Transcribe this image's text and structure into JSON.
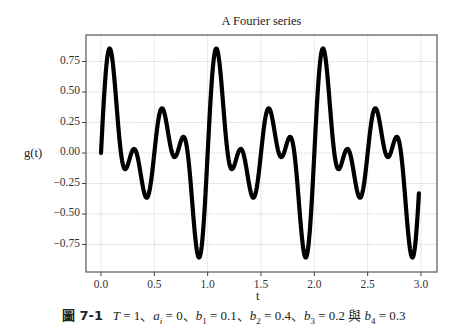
{
  "chart_data": {
    "type": "line",
    "title": "A Fourier series",
    "xlabel": "t",
    "ylabel": "g(t)",
    "xlim": [
      -0.12,
      3.15
    ],
    "ylim": [
      -0.93,
      0.93
    ],
    "x_ticks": [
      "0.0",
      "0.5",
      "1.0",
      "1.5",
      "2.0",
      "2.5",
      "3.0"
    ],
    "y_ticks": [
      "0.75",
      "0.50",
      "0.25",
      "0.00",
      "−0.25",
      "−0.50",
      "−0.75"
    ],
    "grid": true,
    "legend": null,
    "series": [
      {
        "name": "g(t)",
        "formula": "0.1 sin(2πt) + 0.4 sin(4πt) + 0.2 sin(6πt) + 0.3 sin(8πt)",
        "x_range": [
          0,
          2.98
        ],
        "color": "#000000",
        "key_points": [
          {
            "t": 0.0,
            "g": 0.0
          },
          {
            "t": 0.08,
            "g": 0.86
          },
          {
            "t": 0.2,
            "g": -0.12
          },
          {
            "t": 0.25,
            "g": 0.03
          },
          {
            "t": 0.34,
            "g": -0.36
          },
          {
            "t": 0.5,
            "g": 0.37
          },
          {
            "t": 0.6,
            "g": -0.03
          },
          {
            "t": 0.66,
            "g": 0.13
          },
          {
            "t": 0.75,
            "g": -0.03
          },
          {
            "t": 0.92,
            "g": -0.86
          },
          {
            "t": 1.08,
            "g": 0.86
          },
          {
            "t": 2.08,
            "g": 0.86
          },
          {
            "t": 2.92,
            "g": -0.86
          },
          {
            "t": 2.98,
            "g": -0.16
          }
        ]
      }
    ]
  },
  "caption": {
    "figure_label": "圖 7-1",
    "params": [
      {
        "sym": "T",
        "sub": "",
        "eq": " = 1"
      },
      {
        "sym": "a",
        "sub": "i",
        "eq": " = 0"
      },
      {
        "sym": "b",
        "sub": "1",
        "eq": " = 0.1"
      },
      {
        "sym": "b",
        "sub": "2",
        "eq": " = 0.4"
      },
      {
        "sym": "b",
        "sub": "3",
        "eq": " = 0.2"
      },
      {
        "sym": "b",
        "sub": "4",
        "eq": " = 0.3"
      }
    ],
    "sep": "、",
    "and_word": " 與 "
  }
}
